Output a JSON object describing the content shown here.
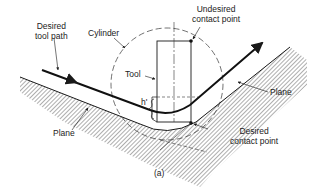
{
  "figure": {
    "caption": "(a)",
    "labels": {
      "desired_tool_path": [
        "Desired",
        "tool path"
      ],
      "cylinder": "Cylinder",
      "undesired_contact_point": [
        "Undesired",
        "contact point"
      ],
      "tool": "Tool",
      "h_prime": "h'",
      "plane_left": "Plane",
      "plane_right": "Plane",
      "desired_contact_point": [
        "Desired",
        "contact point"
      ]
    },
    "colors": {
      "line": "#1a1a1a",
      "background": "#ffffff"
    }
  }
}
